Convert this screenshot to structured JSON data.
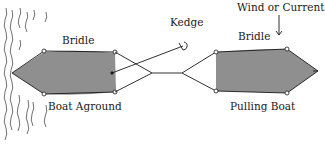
{
  "diagram": {
    "labels": {
      "bridle_left": "Bridle",
      "boat_aground": "Boat Aground",
      "kedge": "Kedge",
      "wind_current": "Wind or Current",
      "bridle_right": "Bridle",
      "pulling_boat": "Pulling Boat"
    },
    "colors": {
      "hull_fill": "#8f8f8f",
      "line": "#1a1a1a",
      "background": "#ffffff"
    },
    "icons": [
      "anchor-icon",
      "wind-arrow-icon",
      "shore-hatching"
    ]
  }
}
